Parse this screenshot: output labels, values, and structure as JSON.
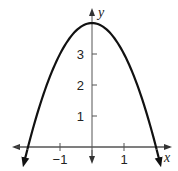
{
  "chart_data": {
    "type": "line",
    "title": "",
    "xlabel": "x",
    "ylabel": "y",
    "equation_shape": "downward parabola, vertex (0, 4), x-intercepts (-2, 0) and (2, 0)",
    "x": [
      -2.1,
      -2,
      -1.5,
      -1,
      -0.5,
      0,
      0.5,
      1,
      1.5,
      2,
      2.1
    ],
    "series": [
      {
        "name": "curve",
        "values": [
          -0.41,
          0,
          1.75,
          3,
          3.75,
          4,
          3.75,
          3,
          1.75,
          0,
          -0.41
        ]
      }
    ],
    "x_ticks": [
      -1,
      1
    ],
    "x_tick_labels": [
      "−1",
      "1"
    ],
    "y_ticks": [
      1,
      2,
      3
    ],
    "y_tick_labels": [
      "1",
      "2",
      "3"
    ],
    "xlim": [
      -2.5,
      2.5
    ],
    "ylim": [
      -0.6,
      4.3
    ],
    "grid": false,
    "legend": "none",
    "colors": {
      "curve": "#111111",
      "axes": "#555555"
    }
  }
}
